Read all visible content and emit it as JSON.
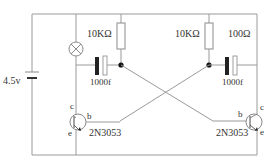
{
  "diagram": {
    "type": "astable multivibrator circuit",
    "battery": {
      "label": "4.5v"
    },
    "lamp": {
      "symbol": "lamp-cross-circle"
    },
    "resistors": [
      {
        "id": "R1",
        "label": "10KΩ"
      },
      {
        "id": "R2",
        "label": "10KΩ"
      },
      {
        "id": "R3",
        "label": "100Ω"
      }
    ],
    "capacitors": [
      {
        "id": "C1",
        "label": "1000f"
      },
      {
        "id": "C2",
        "label": "1000f"
      }
    ],
    "transistors": [
      {
        "id": "Q1",
        "label": "2N3053",
        "pins": {
          "c": "c",
          "b": "b",
          "e": "e"
        }
      },
      {
        "id": "Q2",
        "label": "2N3053",
        "pins": {
          "c": "c",
          "b": "b",
          "e": "e"
        }
      }
    ]
  }
}
